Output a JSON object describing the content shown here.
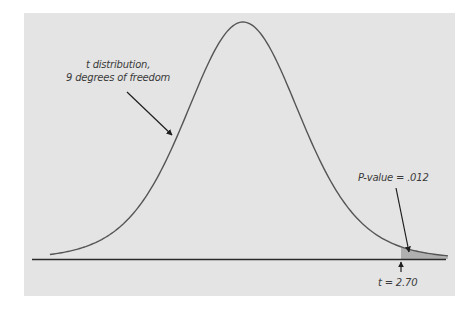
{
  "chart_data": {
    "type": "line",
    "title": "",
    "xlabel": "",
    "ylabel": "",
    "distribution": "t",
    "degrees_of_freedom": 9,
    "x_range": [
      -3.3,
      3.5
    ],
    "observed_t": 2.7,
    "p_value": 0.012,
    "shaded_tail": "right",
    "grid": false,
    "legend": "none",
    "annotations": [
      {
        "text_line1": "t distribution,",
        "text_line2": "9 degrees of freedom",
        "points_to": "curve left flank"
      },
      {
        "text": "P-value = .012",
        "points_to": "right tail area beyond t = 2.70"
      },
      {
        "text": "t = 2.70",
        "points_to": "observed test statistic on axis"
      }
    ]
  },
  "labels": {
    "curve_line1": "t distribution,",
    "curve_line2": "9 degrees of freedom",
    "p_value": "P-value = .012",
    "t_value": "t = 2.70"
  },
  "colors": {
    "panel": "#e4e4e4",
    "curve": "#555555",
    "axis": "#2a2a2a",
    "tail_fill": "#9a9a9a",
    "arrow": "#1e1e1e"
  }
}
